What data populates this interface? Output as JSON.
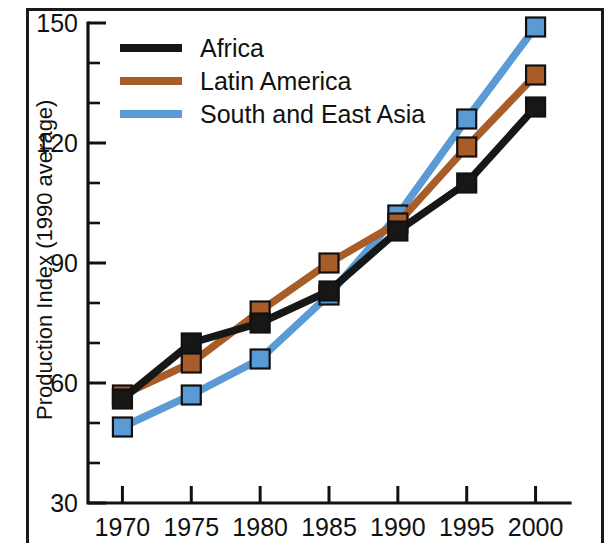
{
  "chart_data": {
    "type": "line",
    "title": "",
    "xlabel": "",
    "ylabel": "Production Index (1990 average)",
    "x": [
      1970,
      1975,
      1980,
      1985,
      1990,
      1995,
      2000
    ],
    "xtick_labels": [
      "1970",
      "1975",
      "1980",
      "1985",
      "1990",
      "1995",
      "2000"
    ],
    "ytick_labels": [
      "150",
      "120",
      "90",
      "60",
      "30"
    ],
    "yticks": [
      150,
      120,
      90,
      60,
      30
    ],
    "ylim": [
      30,
      150
    ],
    "xlim": [
      1967.5,
      2002.5
    ],
    "y_minor_step": 10,
    "grid": false,
    "legend_position": "top-left",
    "series": [
      {
        "name": "Africa",
        "color": "#171717",
        "marker": "square",
        "values": [
          56,
          70,
          75,
          83,
          98,
          110,
          129
        ]
      },
      {
        "name": "Latin America",
        "color": "#a85c28",
        "marker": "square",
        "values": [
          57,
          65,
          78,
          90,
          100,
          119,
          137
        ]
      },
      {
        "name": "South and East Asia",
        "color": "#5b9bd5",
        "marker": "square",
        "values": [
          49,
          57,
          66,
          82,
          102,
          126,
          149
        ]
      }
    ]
  },
  "legend": {
    "entries": [
      {
        "label": "Africa",
        "color": "#171717"
      },
      {
        "label": "Latin America",
        "color": "#a85c28"
      },
      {
        "label": "South and East Asia",
        "color": "#5b9bd5"
      }
    ]
  },
  "axes": {
    "y_axis_title": "Production Index (1990 average)",
    "y_tick_labels": [
      "150",
      "120",
      "90",
      "60",
      "30"
    ],
    "x_tick_labels": [
      "1970",
      "1975",
      "1980",
      "1985",
      "1990",
      "1995",
      "2000"
    ]
  },
  "colors": {
    "africa": "#171717",
    "latin_america": "#a85c28",
    "south_and_east_asia": "#5b9bd5",
    "axis": "#111111",
    "background": "#ffffff"
  }
}
